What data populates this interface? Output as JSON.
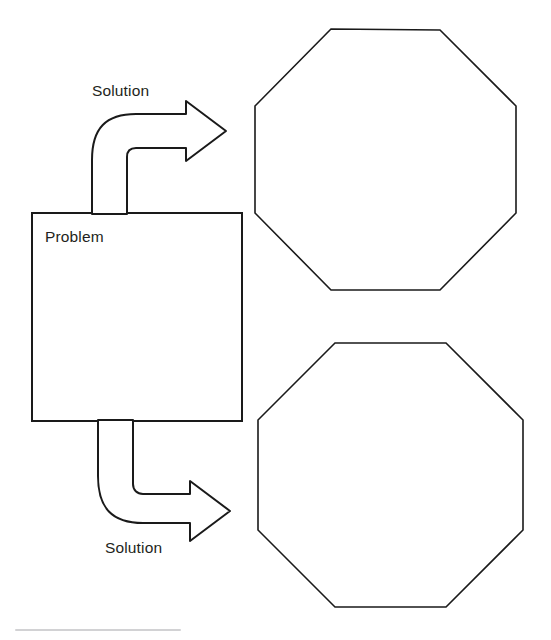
{
  "diagram": {
    "type": "problem-solution-flow",
    "canvas": {
      "width": 551,
      "height": 640,
      "background": "#ffffff"
    },
    "stroke_color": "#1a1a1a",
    "text_color": "#231f20",
    "problem_box": {
      "label": "Problem",
      "x": 32,
      "y": 213,
      "width": 210,
      "height": 208
    },
    "arrows": [
      {
        "name": "solution-arrow-top",
        "label": "Solution",
        "direction": "up-then-right",
        "from": "problem_box.top",
        "to": "octagon-top",
        "tip_x": 226,
        "tip_y": 131
      },
      {
        "name": "solution-arrow-bottom",
        "label": "Solution",
        "direction": "down-then-right",
        "from": "problem_box.bottom",
        "to": "octagon-bottom",
        "tip_x": 230,
        "tip_y": 511
      }
    ],
    "octagons": [
      {
        "name": "octagon-top",
        "label": "",
        "center_x": 385,
        "center_y": 159,
        "width": 261,
        "height": 261
      },
      {
        "name": "octagon-bottom",
        "label": "",
        "center_x": 390,
        "center_y": 475,
        "width": 265,
        "height": 264
      }
    ],
    "footer_rule": {
      "x": 15,
      "y": 629,
      "width": 166,
      "color": "#d2d2d4"
    }
  }
}
